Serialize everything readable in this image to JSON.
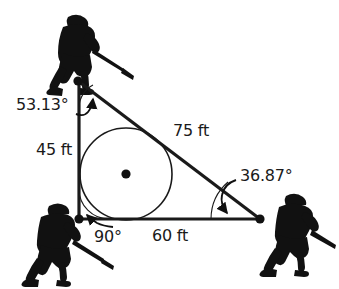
{
  "figure": {
    "background_color": "#ffffff",
    "stroke_color": "#1a1a1a",
    "labels": {
      "angle_top": "53.13°",
      "side_left": "45 ft",
      "side_hypotenuse": "75 ft",
      "angle_right": "36.87°",
      "angle_bottom_left": "90°",
      "side_bottom": "60 ft"
    },
    "vertices": {
      "top": {
        "x": 78,
        "y": 81
      },
      "bottom_left": {
        "x": 79,
        "y": 219
      },
      "bottom_right": {
        "x": 260,
        "y": 219
      }
    },
    "incircle": {
      "center_x": 126,
      "center_y": 174,
      "radius": 46
    },
    "players": [
      {
        "name": "player-top-left",
        "x": 48,
        "y": 14
      },
      {
        "name": "player-bottom-left",
        "x": 16,
        "y": 200
      },
      {
        "name": "player-bottom-right",
        "x": 264,
        "y": 190
      }
    ]
  }
}
